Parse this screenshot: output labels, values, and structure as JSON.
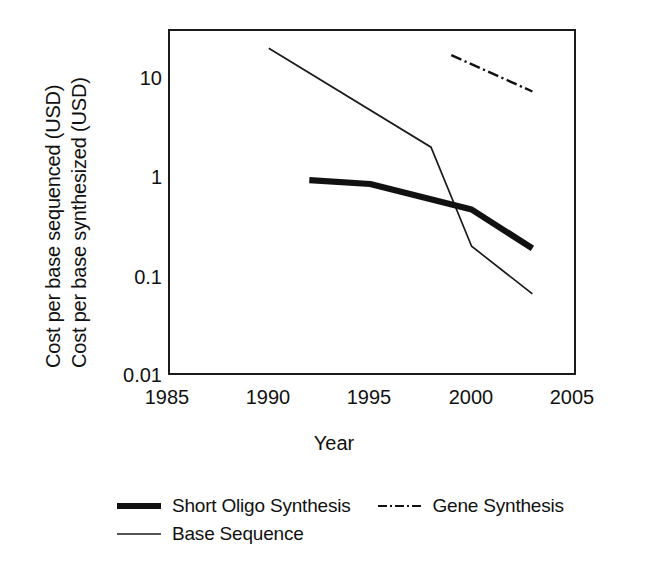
{
  "chart_data": {
    "type": "line",
    "title": "",
    "xlabel": "Year",
    "ylabel_lines": [
      "Cost per base sequenced (USD)",
      "Cost per base synthesized (USD)"
    ],
    "yscale": "log",
    "xlim": [
      1985,
      2005
    ],
    "ylim": [
      0.01,
      31
    ],
    "xticks": [
      1985,
      1990,
      1995,
      2000,
      2005
    ],
    "xtick_labels": [
      "1985",
      "1990",
      "1995",
      "2000",
      "2005"
    ],
    "yticks": [
      0.01,
      0.1,
      1,
      10
    ],
    "ytick_labels": [
      "0.01",
      "0.1",
      "1",
      "10"
    ],
    "grid": false,
    "legend_position": "below",
    "series": [
      {
        "name": "Short Oligo Synthesis",
        "style": "solid-thick",
        "color": "#111111",
        "x": [
          1992,
          1995,
          2000,
          2003
        ],
        "values": [
          0.93,
          0.85,
          0.47,
          0.19
        ]
      },
      {
        "name": "Gene Synthesis",
        "style": "dash-dot",
        "color": "#111111",
        "x": [
          1999,
          2003
        ],
        "values": [
          17.0,
          7.3
        ]
      },
      {
        "name": "Base Sequence",
        "style": "solid-thin",
        "color": "#111111",
        "x": [
          1990,
          1998,
          2000,
          2003
        ],
        "values": [
          20.0,
          2.0,
          0.2,
          0.066
        ]
      }
    ]
  },
  "axes": {
    "x_title": "Year",
    "y_title_line_1": "Cost per base sequenced (USD)",
    "y_title_line_2": "Cost per base synthesized (USD)",
    "x_tick_labels": [
      "1985",
      "1990",
      "1995",
      "2000",
      "2005"
    ],
    "y_tick_labels": [
      "10",
      "1",
      "0.1",
      "0.01"
    ]
  },
  "legend": {
    "rows": [
      [
        {
          "label": "Short Oligo Synthesis",
          "swatch": "thick-line-swatch"
        },
        {
          "label": "Gene Synthesis",
          "swatch": "dash-dot-line-swatch"
        }
      ],
      [
        {
          "label": "Base Sequence",
          "swatch": "thin-line-swatch"
        }
      ]
    ]
  }
}
